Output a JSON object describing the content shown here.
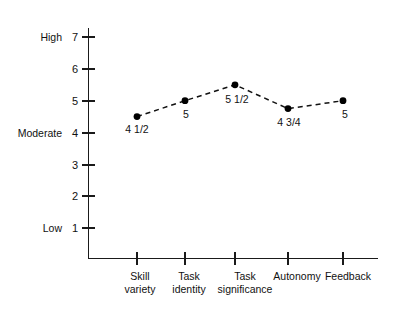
{
  "chart_data": {
    "type": "line",
    "title": "",
    "subtitle": "",
    "xlabel": "",
    "ylabel": "",
    "categories": [
      "Skill variety",
      "Task identity",
      "Task significance",
      "Autonomy",
      "Feedback"
    ],
    "category_lines": [
      [
        "Skill",
        "variety"
      ],
      [
        "Task",
        "identity"
      ],
      [
        "Task",
        "significance"
      ],
      [
        "Autonomy",
        ""
      ],
      [
        "Feedback",
        ""
      ]
    ],
    "values": [
      4.5,
      5,
      5.5,
      4.75,
      5
    ],
    "point_labels": [
      "4 1/2",
      "5",
      "5 1/2",
      "4 3/4",
      "5"
    ],
    "ylim": [
      0,
      7.6
    ],
    "y_ticks": [
      1,
      2,
      3,
      4,
      5,
      6,
      7
    ],
    "y_tick_labels": [
      "1",
      "2",
      "3",
      "4",
      "5",
      "6",
      "7"
    ],
    "y_band_labels": [
      {
        "label": "High",
        "value": 7
      },
      {
        "label": "Moderate",
        "value": 4
      },
      {
        "label": "Low",
        "value": 1
      }
    ],
    "grid": false,
    "legend": "none",
    "line_style": "dashed",
    "marker": "filled-circle",
    "colors": {
      "line": "#111111",
      "marker": "#000000",
      "axis": "#1a1a1a",
      "text": "#111111",
      "background": "#ffffff"
    }
  }
}
